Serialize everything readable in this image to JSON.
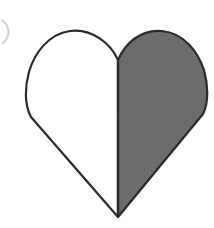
{
  "canvas": {
    "width": 214,
    "height": 228,
    "background_color": "#ffffff"
  },
  "figure": {
    "name": "two-tone-heart",
    "outline_color": "#2b2b2b",
    "outline_width": 2.2,
    "left_half": {
      "label": "left-half",
      "fill_color": "#ffffff",
      "filled": "no"
    },
    "right_half": {
      "label": "right-half",
      "fill_color": "#6d6d6d",
      "filled": "yes"
    },
    "geometry": {
      "cleft_x": 118,
      "cleft_y": 60,
      "tip_x": 118,
      "tip_y": 217,
      "lobe_top_y": 30,
      "left_extreme_x": 27,
      "right_extreme_x": 204,
      "widest_y": 92
    }
  },
  "artifacts": {
    "edge_mark": {
      "label": "clipped-parenthesis-mark",
      "color": "#cfcfcf",
      "x": 2,
      "y": 20,
      "width": 8,
      "height": 23
    }
  }
}
